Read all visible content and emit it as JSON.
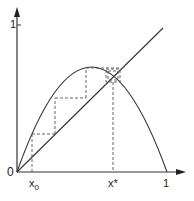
{
  "diagram": {
    "labels": {
      "origin": "0",
      "y_one": "1",
      "x_one": "1",
      "x0_base": "x",
      "x0_sub": "0",
      "xstar": "x*"
    },
    "colors": {
      "line": "#333333",
      "dashed": "#555555"
    }
  }
}
